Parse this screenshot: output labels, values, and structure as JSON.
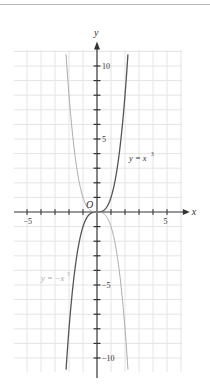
{
  "chart_data": {
    "type": "line",
    "title": "",
    "xlabel": "x",
    "ylabel": "y",
    "origin_label": "O",
    "xlim": [
      -6,
      6
    ],
    "ylim": [
      -11,
      11
    ],
    "x_ticks": [
      -5,
      -4,
      -3,
      -2,
      -1,
      1,
      2,
      3,
      4,
      5
    ],
    "x_tick_labels": [
      {
        "value": -5,
        "label": "-5"
      },
      {
        "value": 5,
        "label": "5"
      }
    ],
    "y_ticks": [
      -10,
      -9,
      -8,
      -7,
      -6,
      -5,
      -4,
      -3,
      -2,
      -1,
      1,
      2,
      3,
      4,
      5,
      6,
      7,
      8,
      9,
      10
    ],
    "y_tick_labels": [
      {
        "value": 10,
        "label": "10"
      },
      {
        "value": 5,
        "label": "5"
      },
      {
        "value": -5,
        "label": "-5"
      },
      {
        "value": -10,
        "label": "-10"
      }
    ],
    "grid": true,
    "series": [
      {
        "name": "y = x³",
        "label": "y = x",
        "exponent": "3",
        "function": "x^3",
        "color": "#555555",
        "x": [
          -2.2,
          -2,
          -1.5,
          -1,
          -0.5,
          0,
          0.5,
          1,
          1.5,
          2,
          2.2
        ],
        "values": [
          -10.65,
          -8,
          -3.375,
          -1,
          -0.125,
          0,
          0.125,
          1,
          3.375,
          8,
          10.65
        ]
      },
      {
        "name": "y = -x³",
        "label": "y = -x",
        "exponent": "3",
        "function": "-x^3",
        "color": "#aaaaaa",
        "x": [
          -2.2,
          -2,
          -1.5,
          -1,
          -0.5,
          0,
          0.5,
          1,
          1.5,
          2,
          2.2
        ],
        "values": [
          10.65,
          8,
          3.375,
          1,
          0.125,
          0,
          -0.125,
          -1,
          -3.375,
          -8,
          -10.65
        ]
      }
    ],
    "legend": "inline labels near curves"
  }
}
